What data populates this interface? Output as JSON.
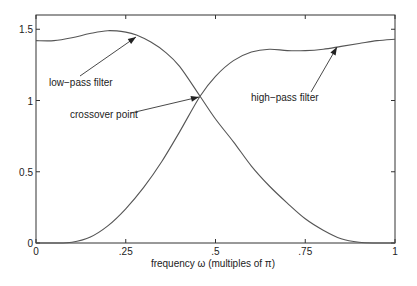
{
  "chart_data": {
    "type": "line",
    "title": "",
    "xlabel": "frequency ω (multiples of π)",
    "ylabel": "",
    "xlim": [
      0,
      1
    ],
    "ylim": [
      0,
      1.6
    ],
    "grid": false,
    "legend": null,
    "xticks": [
      0,
      0.25,
      0.5,
      0.75,
      1
    ],
    "xtick_labels": [
      "0",
      ".25",
      ".5",
      ".75",
      "1"
    ],
    "yticks": [
      0,
      0.5,
      1,
      1.5
    ],
    "ytick_labels": [
      "0",
      "0.5",
      "1",
      "1.5"
    ],
    "series": [
      {
        "name": "low-pass filter",
        "x": [
          0,
          0.05,
          0.1,
          0.15,
          0.2,
          0.25,
          0.28,
          0.32,
          0.36,
          0.4,
          0.457,
          0.5,
          0.55,
          0.6,
          0.65,
          0.7,
          0.75,
          0.8,
          0.85,
          0.9,
          0.95,
          1
        ],
        "y": [
          1.42,
          1.42,
          1.44,
          1.47,
          1.49,
          1.48,
          1.46,
          1.41,
          1.34,
          1.24,
          1.03,
          0.87,
          0.71,
          0.54,
          0.4,
          0.28,
          0.17,
          0.09,
          0.03,
          0.005,
          0,
          0
        ]
      },
      {
        "name": "high-pass filter",
        "x": [
          0,
          0.05,
          0.1,
          0.15,
          0.2,
          0.25,
          0.3,
          0.35,
          0.4,
          0.457,
          0.5,
          0.55,
          0.6,
          0.65,
          0.7,
          0.75,
          0.8,
          0.85,
          0.9,
          0.95,
          1
        ],
        "y": [
          0,
          0,
          0.005,
          0.04,
          0.12,
          0.24,
          0.39,
          0.57,
          0.78,
          1.03,
          1.17,
          1.28,
          1.34,
          1.36,
          1.35,
          1.35,
          1.36,
          1.38,
          1.4,
          1.42,
          1.43
        ]
      }
    ],
    "annotations": [
      {
        "text": "low−pass filter",
        "text_x": 49,
        "text_y": 86,
        "arrow_from": [
          80,
          76
        ],
        "arrow_to": [
          136,
          37
        ]
      },
      {
        "text": "crossover point",
        "text_x": 70,
        "text_y": 118,
        "arrow_from": [
          131,
          113
        ],
        "arrow_to": [
          199,
          97
        ]
      },
      {
        "text": "high−pass filter",
        "text_x": 251,
        "text_y": 101,
        "arrow_from": [
          311,
          92
        ],
        "arrow_to": [
          337,
          47
        ]
      }
    ],
    "crossover": {
      "x": 0.457,
      "y": 1.03
    }
  },
  "layout": {
    "plot_left": 36,
    "plot_right": 395,
    "plot_top": 15,
    "plot_bottom": 243
  }
}
